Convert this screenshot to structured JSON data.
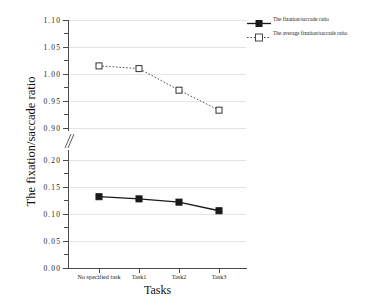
{
  "chart_data": {
    "type": "line",
    "title": "",
    "xlabel": "Tasks",
    "ylabel": "The fixation/saccade ratio",
    "categories": [
      "No specified task",
      "Task1",
      "Task2",
      "Task3"
    ],
    "series": [
      {
        "name": "The fixation/saccade ratio",
        "values": [
          0.132,
          0.128,
          0.122,
          0.106
        ],
        "marker": "filled-square",
        "line_style": "solid",
        "color": "#1a1a1a"
      },
      {
        "name": "The average fixation/saccade ratio",
        "values": [
          1.015,
          1.01,
          0.97,
          0.933
        ],
        "marker": "open-square",
        "line_style": "dotted",
        "color": "#555555"
      }
    ],
    "axis_break": true,
    "grid": true,
    "legend_position": "top-right",
    "y_axis_segments": [
      {
        "name": "lower",
        "ylim": [
          0.0,
          0.2
        ],
        "ticks": [
          "0.00",
          "0.05",
          "0.10",
          "0.15",
          "0.20"
        ]
      },
      {
        "name": "upper",
        "ylim": [
          0.9,
          1.1
        ],
        "ticks": [
          "0.90",
          "0.95",
          "1.00",
          "1.05",
          "1.10"
        ]
      }
    ],
    "y_tick_labels": [
      "1.10",
      "1.05",
      "1.00",
      "0.95",
      "0.90",
      "0.20",
      "0.15",
      "0.10",
      "0.05",
      "0.00"
    ]
  },
  "legend": {
    "items": [
      {
        "label": "The fixation/saccade ratio"
      },
      {
        "label": "The average fixation/saccade ratio"
      }
    ]
  }
}
